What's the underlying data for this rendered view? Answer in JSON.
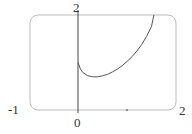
{
  "chart_data": {
    "type": "line",
    "title": "",
    "xlabel": "",
    "ylabel": "",
    "xlim": [
      -1,
      2
    ],
    "ylim": [
      0,
      2
    ],
    "grid": false,
    "legend": null,
    "tick_labels": {
      "x_min": "-1",
      "x_origin": "0",
      "x_max": "2",
      "y_max": "2"
    },
    "series": [
      {
        "name": "f(x)",
        "x": [
          0,
          0.05,
          0.1,
          0.2,
          0.3,
          0.4,
          0.5,
          0.6,
          0.7,
          0.8,
          0.9,
          1.0,
          1.1,
          1.2,
          1.3,
          1.4,
          1.5,
          1.55
        ],
        "y": [
          1.0,
          0.86,
          0.79,
          0.72,
          0.7,
          0.7,
          0.72,
          0.75,
          0.8,
          0.86,
          0.93,
          1.02,
          1.12,
          1.24,
          1.38,
          1.55,
          1.76,
          2.0
        ]
      }
    ],
    "colors": {
      "curve": "#555555",
      "axis": "#444444",
      "frame": "#bbbbbb"
    }
  }
}
